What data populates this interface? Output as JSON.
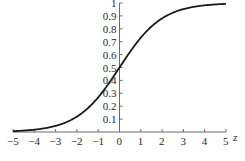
{
  "chart_data": {
    "type": "line",
    "title": "",
    "xlabel": "z",
    "ylabel": "",
    "xlim": [
      -5,
      5
    ],
    "ylim": [
      0,
      1
    ],
    "grid": false,
    "legend": null,
    "x_ticks": [
      "-5",
      "-4",
      "-3",
      "-2",
      "-1",
      "0",
      "1",
      "2",
      "3",
      "4",
      "5"
    ],
    "y_ticks": [
      "0.1",
      "0.2",
      "0.3",
      "0.4",
      "0.5",
      "0.6",
      "0.7",
      "0.8",
      "0.9",
      "1"
    ],
    "series": [
      {
        "name": "sigmoid",
        "function": "1/(1+exp(-z))",
        "x": [
          -5,
          -4,
          -3,
          -2,
          -1,
          0,
          1,
          2,
          3,
          4,
          5
        ],
        "values": [
          0.0067,
          0.018,
          0.047,
          0.119,
          0.269,
          0.5,
          0.731,
          0.881,
          0.953,
          0.982,
          0.993
        ],
        "color": "#1a1a1a"
      }
    ]
  }
}
